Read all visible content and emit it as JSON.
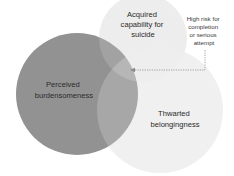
{
  "diagram": {
    "type": "venn",
    "circles": [
      {
        "id": "burdensomeness",
        "label_lines": [
          "Perceived",
          "burdensomeness"
        ],
        "color": "#8e8e8e"
      },
      {
        "id": "capability",
        "label_lines": [
          "Acquired",
          "capability for",
          "suicide"
        ],
        "color": "#ececec"
      },
      {
        "id": "belongingness",
        "label_lines": [
          "Thwarted",
          "belongingness"
        ],
        "color": "#ececec"
      }
    ],
    "annotation": {
      "lines": [
        "High risk for",
        "completion",
        "or serious",
        "attempt"
      ],
      "target": "intersection of all three circles",
      "line_style": "dotted",
      "line_color": "#8a8a8a"
    }
  }
}
